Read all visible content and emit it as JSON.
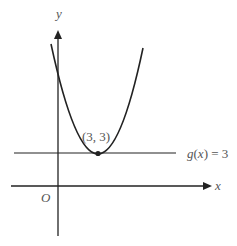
{
  "diagram": {
    "axes": {
      "x_label": "x",
      "y_label": "y",
      "origin_label": "O"
    },
    "curve": {
      "type": "parabola",
      "vertex_label": "(3, 3)",
      "vertex": [
        3,
        3
      ]
    },
    "line": {
      "label": "g(x) = 3",
      "label_func": "g",
      "label_open": "(",
      "label_var": "x",
      "label_close": ")",
      "label_eq": " = 3"
    },
    "colors": {
      "stroke": "#222222",
      "text": "#555555"
    }
  }
}
